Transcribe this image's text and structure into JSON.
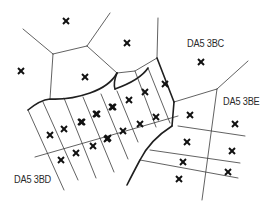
{
  "diagram": {
    "type": "voronoi-postcode-map",
    "colors": {
      "line": "#3a3a3a",
      "marker": "#111111",
      "text": "#2a2a2a",
      "background": "#ffffff"
    },
    "labels": [
      {
        "id": "da5-3bc",
        "text": "DA5 3BC",
        "x": 187,
        "y": 38
      },
      {
        "id": "da5-3be",
        "text": "DA5 3BE",
        "x": 223,
        "y": 96
      },
      {
        "id": "da5-3bd",
        "text": "DA5 3BD",
        "x": 14,
        "y": 174
      }
    ],
    "marker_icon": "cross-icon",
    "markers": [
      [
        66,
        21
      ],
      [
        127,
        43
      ],
      [
        21,
        71
      ],
      [
        85,
        77
      ],
      [
        201,
        62
      ],
      [
        165,
        84
      ],
      [
        145,
        92
      ],
      [
        129,
        100
      ],
      [
        113,
        107
      ],
      [
        97,
        114
      ],
      [
        82,
        122
      ],
      [
        112,
        107
      ],
      [
        96,
        114
      ],
      [
        81,
        122
      ],
      [
        64,
        129
      ],
      [
        50,
        135
      ],
      [
        156,
        117
      ],
      [
        140,
        124
      ],
      [
        123,
        131
      ],
      [
        108,
        138
      ],
      [
        107,
        139
      ],
      [
        93,
        146
      ],
      [
        76,
        153
      ],
      [
        61,
        160
      ],
      [
        190,
        115
      ],
      [
        235,
        124
      ],
      [
        187,
        142
      ],
      [
        232,
        151
      ],
      [
        183,
        162
      ],
      [
        228,
        172
      ],
      [
        179,
        179
      ]
    ]
  }
}
